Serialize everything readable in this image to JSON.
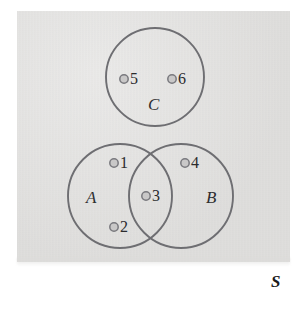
{
  "figure": {
    "kind": "venn-diagram",
    "universe": {
      "label": "S",
      "fill_color": "#dcdbd9"
    },
    "stroke_color": "#6e6e72",
    "marker_fill_color": "#c9c8c8",
    "marker_stroke_color": "#79797e",
    "sets": [
      {
        "id": "A",
        "label": "A",
        "cx": 120,
        "cy": 196,
        "r": 52,
        "label_x": 86,
        "label_y": 188
      },
      {
        "id": "B",
        "label": "B",
        "cx": 181,
        "cy": 196,
        "r": 52,
        "label_x": 206,
        "label_y": 188
      },
      {
        "id": "C",
        "label": "C",
        "cx": 155,
        "cy": 77,
        "r": 49,
        "label_x": 148,
        "label_y": 95
      }
    ],
    "elements": [
      {
        "label": "1",
        "region": "A only",
        "dot_x": 114,
        "dot_y": 163,
        "text_x": 120,
        "text_y": 154
      },
      {
        "label": "2",
        "region": "A only",
        "dot_x": 114,
        "dot_y": 227,
        "text_x": 120,
        "text_y": 218
      },
      {
        "label": "3",
        "region": "A and B",
        "dot_x": 146,
        "dot_y": 196,
        "text_x": 152,
        "text_y": 187
      },
      {
        "label": "4",
        "region": "B only",
        "dot_x": 185,
        "dot_y": 163,
        "text_x": 191,
        "text_y": 154
      },
      {
        "label": "5",
        "region": "C only",
        "dot_x": 124,
        "dot_y": 79,
        "text_x": 130,
        "text_y": 70
      },
      {
        "label": "6",
        "region": "C only",
        "dot_x": 172,
        "dot_y": 79,
        "text_x": 178,
        "text_y": 70
      }
    ]
  }
}
